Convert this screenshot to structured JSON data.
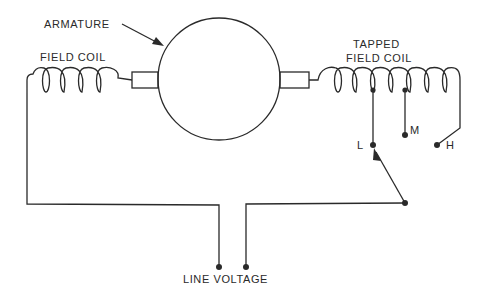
{
  "diagram": {
    "type": "electrical-schematic",
    "colors": {
      "ink": "#2a2a2a",
      "background": "#ffffff"
    },
    "labels": {
      "armature": "ARMATURE",
      "field_coil": "FIELD COIL",
      "tapped_line1": "TAPPED",
      "tapped_line2": "FIELD COIL",
      "tap_low": "L",
      "tap_medium": "M",
      "tap_high": "H",
      "line_voltage": "LINE VOLTAGE"
    },
    "components": [
      {
        "id": "armature",
        "label": "ARMATURE",
        "shape": "circle"
      },
      {
        "id": "field-coil",
        "label": "FIELD COIL",
        "shape": "coil",
        "turns": 5
      },
      {
        "id": "tapped-field-coil",
        "label": "TAPPED FIELD COIL",
        "shape": "coil",
        "turns": 7
      },
      {
        "id": "selector-switch",
        "positions": [
          "L",
          "M",
          "H"
        ],
        "selected": "L"
      },
      {
        "id": "line-voltage",
        "label": "LINE VOLTAGE",
        "terminals": 2
      }
    ]
  }
}
